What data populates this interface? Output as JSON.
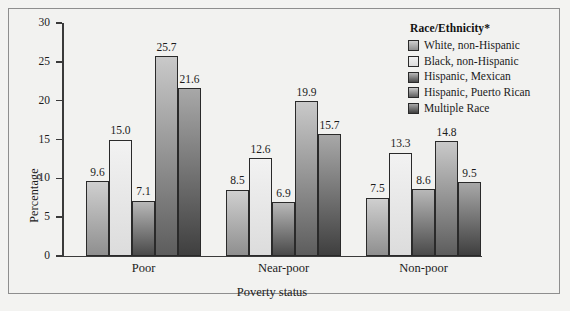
{
  "chart_data": {
    "type": "bar",
    "title": "",
    "xlabel": "Poverty status",
    "ylabel": "Percentage",
    "categories": [
      "Poor",
      "Near-poor",
      "Non-poor"
    ],
    "ylim": [
      0,
      30
    ],
    "yticks": [
      0,
      5,
      10,
      15,
      20,
      25,
      30
    ],
    "ytick_labels": [
      "0",
      "5",
      "10",
      "15",
      "20",
      "25",
      "30"
    ],
    "grid": false,
    "legend_position": "right",
    "legend_title": "Race/Ethnicity*",
    "series": [
      {
        "name": "White, non-Hispanic",
        "color_top": "#cfcfcf",
        "color_bottom": "#8f8f8f",
        "values": [
          9.6,
          8.5,
          7.5
        ],
        "labels": [
          "9.6",
          "8.5",
          "7.5"
        ]
      },
      {
        "name": "Black, non-Hispanic",
        "color_top": "#f2f2f2",
        "color_bottom": "#dcdcdc",
        "values": [
          15.0,
          12.6,
          13.3
        ],
        "labels": [
          "15.0",
          "12.6",
          "13.3"
        ]
      },
      {
        "name": "Hispanic, Mexican",
        "color_top": "#b8b8b8",
        "color_bottom": "#4a4a4a",
        "values": [
          7.1,
          6.9,
          8.6
        ],
        "labels": [
          "7.1",
          "6.9",
          "8.6"
        ]
      },
      {
        "name": "Hispanic, Puerto Rican",
        "color_top": "#c9c9c9",
        "color_bottom": "#5d5d5d",
        "values": [
          25.7,
          19.9,
          14.8
        ],
        "labels": [
          "25.7",
          "19.9",
          "14.8"
        ]
      },
      {
        "name": "Multiple Race",
        "color_top": "#a8a8a8",
        "color_bottom": "#3f3f3f",
        "values": [
          21.6,
          15.7,
          9.5
        ],
        "labels": [
          "21.6",
          "15.7",
          "9.5"
        ]
      }
    ]
  }
}
